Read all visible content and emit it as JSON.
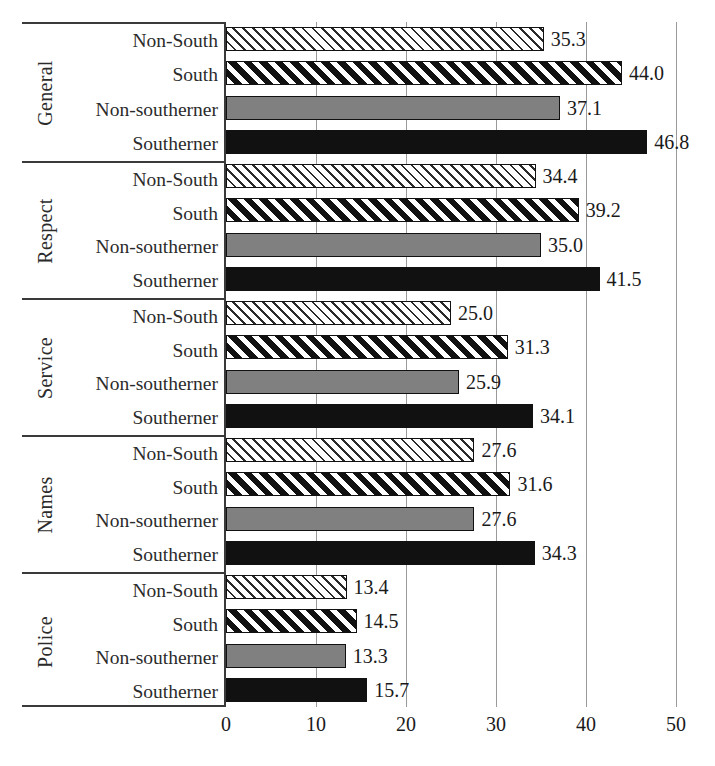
{
  "chart_data": {
    "type": "bar",
    "orientation": "horizontal",
    "title": "",
    "xlabel": "",
    "ylabel": "",
    "xlim": [
      0,
      50
    ],
    "xticks": [
      0,
      10,
      20,
      30,
      40,
      50
    ],
    "xtick_labels": [
      "0",
      "10",
      "20",
      "30",
      "40",
      "50"
    ],
    "grid": "vertical",
    "legend": "none",
    "series_order": [
      "Non-South",
      "South",
      "Non-southerner",
      "Southerner"
    ],
    "series_styles": {
      "Non-South": "light-diagonal-hatch-on-white",
      "South": "bold-white-diagonal-stripes-on-black",
      "Non-southerner": "solid-gray",
      "Southerner": "solid-black"
    },
    "groups": [
      {
        "name": "General",
        "rows": [
          {
            "label": "Non-South",
            "value": 35.3,
            "value_label": "35.3",
            "style": "pat-hatch-light"
          },
          {
            "label": "South",
            "value": 44.0,
            "value_label": "44.0",
            "style": "pat-hatch-bold"
          },
          {
            "label": "Non-southerner",
            "value": 37.1,
            "value_label": "37.1",
            "style": "pat-gray"
          },
          {
            "label": "Southerner",
            "value": 46.8,
            "value_label": "46.8",
            "style": "pat-black"
          }
        ]
      },
      {
        "name": "Respect",
        "rows": [
          {
            "label": "Non-South",
            "value": 34.4,
            "value_label": "34.4",
            "style": "pat-hatch-light"
          },
          {
            "label": "South",
            "value": 39.2,
            "value_label": "39.2",
            "style": "pat-hatch-bold"
          },
          {
            "label": "Non-southerner",
            "value": 35.0,
            "value_label": "35.0",
            "style": "pat-gray"
          },
          {
            "label": "Southerner",
            "value": 41.5,
            "value_label": "41.5",
            "style": "pat-black"
          }
        ]
      },
      {
        "name": "Service",
        "rows": [
          {
            "label": "Non-South",
            "value": 25.0,
            "value_label": "25.0",
            "style": "pat-hatch-light"
          },
          {
            "label": "South",
            "value": 31.3,
            "value_label": "31.3",
            "style": "pat-hatch-bold"
          },
          {
            "label": "Non-southerner",
            "value": 25.9,
            "value_label": "25.9",
            "style": "pat-gray"
          },
          {
            "label": "Southerner",
            "value": 34.1,
            "value_label": "34.1",
            "style": "pat-black"
          }
        ]
      },
      {
        "name": "Names",
        "rows": [
          {
            "label": "Non-South",
            "value": 27.6,
            "value_label": "27.6",
            "style": "pat-hatch-light"
          },
          {
            "label": "South",
            "value": 31.6,
            "value_label": "31.6",
            "style": "pat-hatch-bold"
          },
          {
            "label": "Non-southerner",
            "value": 27.6,
            "value_label": "27.6",
            "style": "pat-gray"
          },
          {
            "label": "Southerner",
            "value": 34.3,
            "value_label": "34.3",
            "style": "pat-black"
          }
        ]
      },
      {
        "name": "Police",
        "rows": [
          {
            "label": "Non-South",
            "value": 13.4,
            "value_label": "13.4",
            "style": "pat-hatch-light"
          },
          {
            "label": "South",
            "value": 14.5,
            "value_label": "14.5",
            "style": "pat-hatch-bold"
          },
          {
            "label": "Non-southerner",
            "value": 13.3,
            "value_label": "13.3",
            "style": "pat-gray"
          },
          {
            "label": "Southerner",
            "value": 15.7,
            "value_label": "15.7",
            "style": "pat-black"
          }
        ]
      }
    ],
    "colors": {
      "gray_fill": "#808080",
      "black_fill": "#111111",
      "gridline": "#9a9a9a",
      "axis_line": "#3a3a3a",
      "text": "#1a1a1a"
    }
  }
}
